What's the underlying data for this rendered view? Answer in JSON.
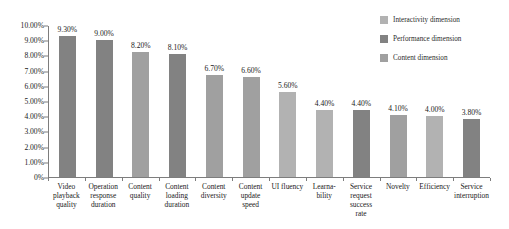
{
  "chart_data": {
    "type": "bar",
    "title": "",
    "subtitle": "",
    "xlabel": "",
    "ylabel": "",
    "ylim": [
      0,
      0.1
    ],
    "grid": false,
    "legend_position": "top-right",
    "ytick_labels": [
      "10.00%",
      "9.00%",
      "8.00%",
      "7.00%",
      "6.00%",
      "5.00%",
      "4.00%",
      "3.00%",
      "2.00%",
      "1.00%",
      "0%"
    ],
    "ytick_values": [
      0.1,
      0.09,
      0.08,
      0.07,
      0.06,
      0.05,
      0.04,
      0.03,
      0.02,
      0.01,
      0
    ],
    "categories": [
      "Video playback quality",
      "Operation response duration",
      "Content quality",
      "Content loading duration",
      "Content diversity",
      "Content update speed",
      "UI fluency",
      "Learna-bility",
      "Service request success rate",
      "Novelty",
      "Efficiency",
      "Service interruption"
    ],
    "values": [
      0.093,
      0.09,
      0.082,
      0.081,
      0.067,
      0.066,
      0.056,
      0.044,
      0.044,
      0.041,
      0.04,
      0.038
    ],
    "data_labels": [
      "9.30%",
      "9.00%",
      "8.20%",
      "8.10%",
      "6.70%",
      "6.60%",
      "5.60%",
      "4.40%",
      "4.40%",
      "4.10%",
      "4.00%",
      "3.80%"
    ],
    "point_series": [
      "Performance dimension",
      "Performance dimension",
      "Content dimension",
      "Performance dimension",
      "Content dimension",
      "Content dimension",
      "Interactivity dimension",
      "Interactivity dimension",
      "Performance dimension",
      "Content dimension",
      "Interactivity dimension",
      "Performance dimension"
    ],
    "series": [
      {
        "name": "Interactivity dimension",
        "color": "#b2b2b2"
      },
      {
        "name": "Performance dimension",
        "color": "#828282"
      },
      {
        "name": "Content dimension",
        "color": "#a0a0a0"
      }
    ]
  },
  "legend": {
    "items": [
      {
        "label": "Interactivity dimension",
        "color": "#b2b2b2"
      },
      {
        "label": "Performance dimension",
        "color": "#828282"
      },
      {
        "label": "Content dimension",
        "color": "#a0a0a0"
      }
    ]
  },
  "axes": {
    "axis_color": "#7d7d7d"
  }
}
